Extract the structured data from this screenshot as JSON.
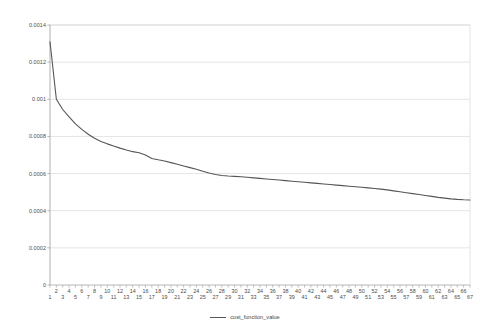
{
  "chart_data": {
    "type": "line",
    "title": "",
    "xlabel": "",
    "ylabel": "",
    "xlim": [
      1,
      67
    ],
    "ylim": [
      0,
      0.0014
    ],
    "grid": true,
    "legend_position": "bottom-center",
    "y_ticks": [
      "0",
      "0.0002",
      "0.0004",
      "0.0006",
      "0.0008",
      "0.001",
      "0.0012",
      "0.0014"
    ],
    "y_tick_values": [
      0,
      0.0002,
      0.0004,
      0.0006,
      0.0008,
      0.001,
      0.0012,
      0.0014
    ],
    "x_ticks": [
      1,
      2,
      3,
      4,
      5,
      6,
      7,
      8,
      9,
      10,
      11,
      12,
      13,
      14,
      15,
      16,
      17,
      18,
      19,
      20,
      21,
      22,
      23,
      24,
      25,
      26,
      27,
      28,
      29,
      30,
      31,
      32,
      33,
      34,
      35,
      36,
      37,
      38,
      39,
      40,
      41,
      42,
      43,
      44,
      45,
      46,
      47,
      48,
      49,
      50,
      51,
      52,
      53,
      54,
      55,
      56,
      57,
      58,
      59,
      60,
      61,
      62,
      63,
      64,
      65,
      66,
      67
    ],
    "line_color": "#555555",
    "grid_color": "#d9d9d9",
    "axis_color": "#a6a6a6",
    "series": [
      {
        "name": "cost_function_value",
        "x": [
          1,
          2,
          3,
          4,
          5,
          6,
          7,
          8,
          9,
          10,
          11,
          12,
          13,
          14,
          15,
          16,
          17,
          18,
          19,
          20,
          21,
          22,
          23,
          24,
          25,
          26,
          27,
          28,
          29,
          30,
          31,
          32,
          33,
          34,
          35,
          36,
          37,
          38,
          39,
          40,
          41,
          42,
          43,
          44,
          45,
          46,
          47,
          48,
          49,
          50,
          51,
          52,
          53,
          54,
          55,
          56,
          57,
          58,
          59,
          60,
          61,
          62,
          63,
          64,
          65,
          66,
          67
        ],
        "values": [
          0.00131,
          0.001,
          0.000945,
          0.000905,
          0.000868,
          0.000838,
          0.000812,
          0.00079,
          0.000773,
          0.00076,
          0.000748,
          0.000737,
          0.000727,
          0.000718,
          0.000712,
          0.0007,
          0.000681,
          0.000674,
          0.000668,
          0.000659,
          0.00065,
          0.000641,
          0.000632,
          0.000623,
          0.000613,
          0.000603,
          0.000595,
          0.00059,
          0.000587,
          0.000585,
          0.000583,
          0.00058,
          0.000577,
          0.000574,
          0.000571,
          0.000568,
          0.000565,
          0.000562,
          0.000559,
          0.000556,
          0.000553,
          0.00055,
          0.000547,
          0.000544,
          0.000541,
          0.000538,
          0.000535,
          0.000532,
          0.000529,
          0.000526,
          0.000523,
          0.00052,
          0.000516,
          0.000512,
          0.000507,
          0.000502,
          0.000497,
          0.000492,
          0.000487,
          0.000482,
          0.000477,
          0.000472,
          0.000468,
          0.000464,
          0.000461,
          0.000459,
          0.000458
        ]
      }
    ]
  },
  "legend": {
    "entries": [
      {
        "label": "cost_function_value"
      }
    ]
  }
}
